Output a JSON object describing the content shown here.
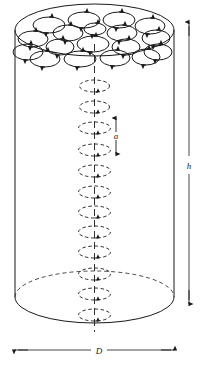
{
  "figure": {
    "type": "technical-diagram",
    "background_color": "#ffffff",
    "ink_color": "#1a1a1a"
  },
  "labels": {
    "diameter": "D",
    "height": "h",
    "cell_spacing": "a"
  },
  "geometry": {
    "cylinder": {
      "left_x": 15,
      "right_x": 174,
      "top_center_y": 30,
      "bottom_center_y": 297,
      "ellipse_rx": 79.5,
      "ellipse_ry": 26
    },
    "axis_x": 94.5,
    "axis_top_y": 30,
    "axis_bottom_y": 330
  },
  "top_face_cells": [
    {
      "cx": 49,
      "cy": 25,
      "rx": 16,
      "ry": 8
    },
    {
      "cx": 84,
      "cy": 20,
      "rx": 16,
      "ry": 8
    },
    {
      "cx": 119,
      "cy": 20,
      "rx": 16,
      "ry": 8
    },
    {
      "cx": 150,
      "cy": 26,
      "rx": 15,
      "ry": 8
    },
    {
      "cx": 33,
      "cy": 39,
      "rx": 15,
      "ry": 8
    },
    {
      "cx": 68,
      "cy": 33,
      "rx": 15,
      "ry": 8
    },
    {
      "cx": 95,
      "cy": 29,
      "rx": 11,
      "ry": 6
    },
    {
      "cx": 122,
      "cy": 33,
      "rx": 15,
      "ry": 8
    },
    {
      "cx": 156,
      "cy": 38,
      "rx": 14,
      "ry": 8
    },
    {
      "cx": 28,
      "cy": 52,
      "rx": 15,
      "ry": 8
    },
    {
      "cx": 60,
      "cy": 47,
      "rx": 14,
      "ry": 8
    },
    {
      "cx": 93,
      "cy": 44,
      "rx": 16,
      "ry": 8
    },
    {
      "cx": 126,
      "cy": 47,
      "rx": 14,
      "ry": 8
    },
    {
      "cx": 158,
      "cy": 52,
      "rx": 14,
      "ry": 8
    },
    {
      "cx": 45,
      "cy": 59,
      "rx": 15,
      "ry": 8
    },
    {
      "cx": 80,
      "cy": 59,
      "rx": 16,
      "ry": 8
    },
    {
      "cx": 115,
      "cy": 58,
      "rx": 15,
      "ry": 8
    },
    {
      "cx": 146,
      "cy": 57,
      "rx": 14,
      "ry": 8
    }
  ],
  "axis_cells": [
    {
      "cy": 86,
      "rx": 15,
      "ry": 6,
      "dashed": true
    },
    {
      "cy": 107,
      "rx": 15,
      "ry": 6,
      "dashed": true
    },
    {
      "cy": 128,
      "rx": 16,
      "ry": 6,
      "dashed": true
    },
    {
      "cy": 150,
      "rx": 16,
      "ry": 6,
      "dashed": true
    },
    {
      "cy": 171,
      "rx": 16,
      "ry": 6,
      "dashed": true
    },
    {
      "cy": 192,
      "rx": 16,
      "ry": 6,
      "dashed": true
    },
    {
      "cy": 212,
      "rx": 16,
      "ry": 6,
      "dashed": true
    },
    {
      "cy": 232,
      "rx": 16,
      "ry": 6,
      "dashed": true
    },
    {
      "cy": 252,
      "rx": 16,
      "ry": 6,
      "dashed": true
    },
    {
      "cy": 274,
      "rx": 16,
      "ry": 6,
      "dashed": true
    },
    {
      "cy": 294,
      "rx": 16,
      "ry": 6,
      "dashed": true
    },
    {
      "cy": 315,
      "rx": 16,
      "ry": 6,
      "dashed": true
    }
  ],
  "dimensions": {
    "height_line": {
      "x": 189,
      "y_top": 22,
      "y_bottom": 303,
      "label_y": 165
    },
    "diameter_line": {
      "y": 350,
      "x_left": 14,
      "x_right": 175,
      "label_x": 100
    },
    "cell_spacing_line": {
      "x": 116,
      "y_top": 118,
      "y_bottom": 150,
      "label_y": 136
    }
  }
}
